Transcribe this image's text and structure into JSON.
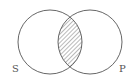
{
  "diagram": {
    "type": "venn",
    "sets": [
      {
        "label": "S",
        "cx": 50,
        "cy": 42,
        "r": 32
      },
      {
        "label": "P",
        "cx": 90,
        "cy": 42,
        "r": 32
      }
    ],
    "shaded_region": "S∩P",
    "shading": "diagonal-hatch",
    "colors": {
      "stroke": "#555555",
      "hatch": "#666666",
      "background": "#ffffff"
    }
  },
  "labels": {
    "left": "S",
    "right": "P"
  }
}
